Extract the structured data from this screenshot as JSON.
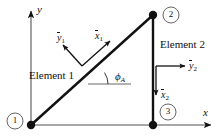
{
  "figure": {
    "type": "structural-frame-diagram",
    "background_color": "#ffffff",
    "line_color": "#111111",
    "global_axes": {
      "x_label": "x",
      "y_label": "y"
    },
    "nodes": [
      {
        "id": "1",
        "label": "1",
        "x": 31,
        "y": 125,
        "label_x": 15,
        "label_y": 121
      },
      {
        "id": "2",
        "label": "2",
        "x": 153,
        "y": 15,
        "label_x": 171,
        "label_y": 15
      },
      {
        "id": "3",
        "label": "3",
        "x": 153,
        "y": 125,
        "label_x": 168,
        "label_y": 112
      }
    ],
    "elements": [
      {
        "id": "e1",
        "label": "Element 1",
        "from": "1",
        "to": "2"
      },
      {
        "id": "e2",
        "label": "Element 2",
        "from": "2",
        "to": "3"
      }
    ],
    "local_axes": [
      {
        "element": "Element 1",
        "x_label": "x",
        "x_sub": "1",
        "y_label": "y",
        "y_sub": "1"
      },
      {
        "element": "Element 2",
        "x_label": "x",
        "x_sub": "2",
        "y_label": "y",
        "y_sub": "2"
      }
    ],
    "angle": {
      "symbol": "ϕ",
      "subscript": "A",
      "description": "angle between Element 1 and global x direction"
    }
  }
}
